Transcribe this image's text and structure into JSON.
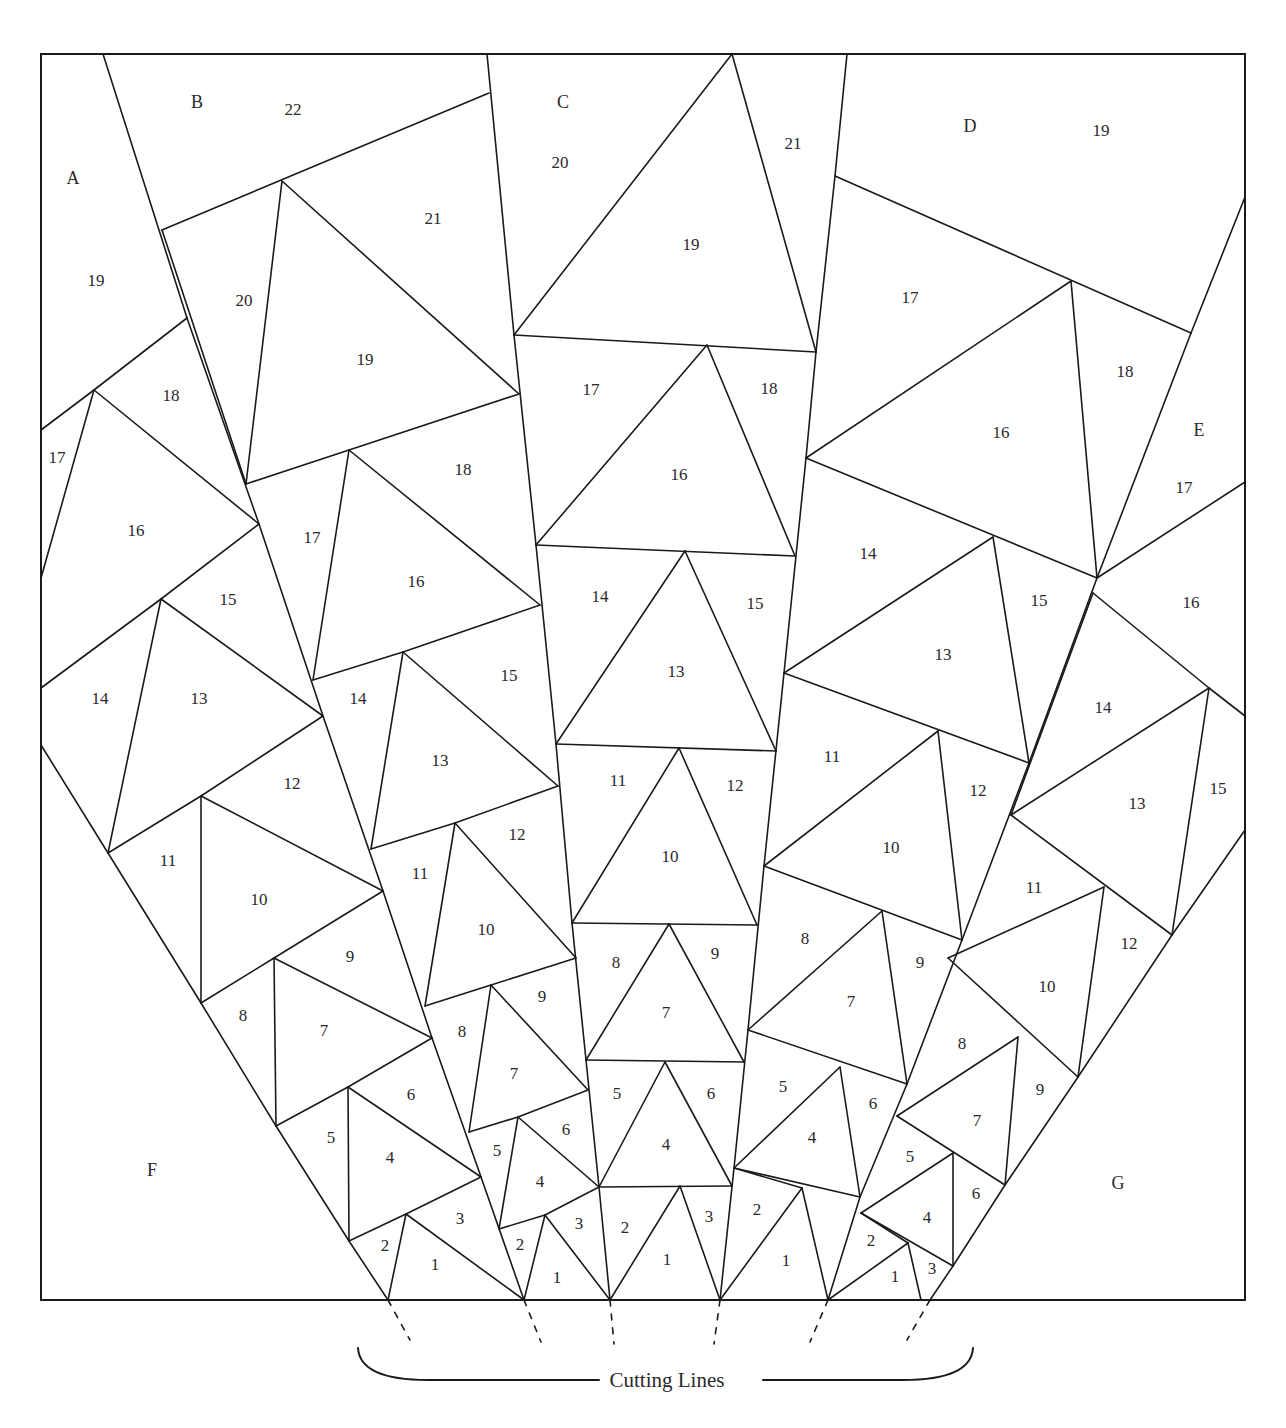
{
  "figure": {
    "type": "foundation paper-piecing quilt pattern",
    "border": {
      "x1": 41,
      "y1": 54,
      "x2": 1245,
      "y2": 1300
    },
    "stroke_color": "#1a1a1a",
    "background": "#ffffff"
  },
  "sections": [
    {
      "id": "A",
      "x": 73,
      "y": 178
    },
    {
      "id": "B",
      "x": 197,
      "y": 102
    },
    {
      "id": "C",
      "x": 563,
      "y": 102
    },
    {
      "id": "D",
      "x": 970,
      "y": 126
    },
    {
      "id": "E",
      "x": 1199,
      "y": 430
    },
    {
      "id": "F",
      "x": 152,
      "y": 1170
    },
    {
      "id": "G",
      "x": 1118,
      "y": 1183
    }
  ],
  "piece_labels": [
    {
      "section": "A",
      "n": "19",
      "x": 96,
      "y": 280
    },
    {
      "section": "A",
      "n": "18",
      "x": 171,
      "y": 395
    },
    {
      "section": "A",
      "n": "17",
      "x": 57,
      "y": 457
    },
    {
      "section": "A",
      "n": "16",
      "x": 136,
      "y": 530
    },
    {
      "section": "A",
      "n": "15",
      "x": 228,
      "y": 599
    },
    {
      "section": "A",
      "n": "14",
      "x": 100,
      "y": 698
    },
    {
      "section": "A",
      "n": "13",
      "x": 199,
      "y": 698
    },
    {
      "section": "A",
      "n": "12",
      "x": 292,
      "y": 783
    },
    {
      "section": "A",
      "n": "11",
      "x": 168,
      "y": 860
    },
    {
      "section": "A",
      "n": "10",
      "x": 259,
      "y": 899
    },
    {
      "section": "A",
      "n": "9",
      "x": 350,
      "y": 956
    },
    {
      "section": "A",
      "n": "8",
      "x": 243,
      "y": 1015
    },
    {
      "section": "A",
      "n": "7",
      "x": 324,
      "y": 1030
    },
    {
      "section": "A",
      "n": "6",
      "x": 411,
      "y": 1094
    },
    {
      "section": "A",
      "n": "5",
      "x": 331,
      "y": 1137
    },
    {
      "section": "A",
      "n": "4",
      "x": 390,
      "y": 1157
    },
    {
      "section": "A",
      "n": "3",
      "x": 460,
      "y": 1218
    },
    {
      "section": "A",
      "n": "2",
      "x": 385,
      "y": 1245
    },
    {
      "section": "A",
      "n": "1",
      "x": 435,
      "y": 1264
    },
    {
      "section": "B",
      "n": "22",
      "x": 293,
      "y": 109
    },
    {
      "section": "B",
      "n": "21",
      "x": 433,
      "y": 218
    },
    {
      "section": "B",
      "n": "20",
      "x": 244,
      "y": 300
    },
    {
      "section": "B",
      "n": "19",
      "x": 365,
      "y": 359
    },
    {
      "section": "B",
      "n": "18",
      "x": 463,
      "y": 469
    },
    {
      "section": "B",
      "n": "17",
      "x": 312,
      "y": 537
    },
    {
      "section": "B",
      "n": "16",
      "x": 416,
      "y": 581
    },
    {
      "section": "B",
      "n": "15",
      "x": 509,
      "y": 675
    },
    {
      "section": "B",
      "n": "14",
      "x": 358,
      "y": 698
    },
    {
      "section": "B",
      "n": "13",
      "x": 440,
      "y": 760
    },
    {
      "section": "B",
      "n": "12",
      "x": 517,
      "y": 834
    },
    {
      "section": "B",
      "n": "11",
      "x": 420,
      "y": 873
    },
    {
      "section": "B",
      "n": "10",
      "x": 486,
      "y": 929
    },
    {
      "section": "B",
      "n": "9",
      "x": 542,
      "y": 996
    },
    {
      "section": "B",
      "n": "8",
      "x": 462,
      "y": 1031
    },
    {
      "section": "B",
      "n": "7",
      "x": 514,
      "y": 1073
    },
    {
      "section": "B",
      "n": "6",
      "x": 566,
      "y": 1129
    },
    {
      "section": "B",
      "n": "5",
      "x": 497,
      "y": 1150
    },
    {
      "section": "B",
      "n": "4",
      "x": 540,
      "y": 1181
    },
    {
      "section": "B",
      "n": "3",
      "x": 579,
      "y": 1223
    },
    {
      "section": "B",
      "n": "2",
      "x": 520,
      "y": 1244
    },
    {
      "section": "B",
      "n": "1",
      "x": 557,
      "y": 1277
    },
    {
      "section": "C",
      "n": "20",
      "x": 560,
      "y": 162
    },
    {
      "section": "C",
      "n": "21",
      "x": 793,
      "y": 143
    },
    {
      "section": "C",
      "n": "19",
      "x": 691,
      "y": 244
    },
    {
      "section": "C",
      "n": "17",
      "x": 591,
      "y": 389
    },
    {
      "section": "C",
      "n": "18",
      "x": 769,
      "y": 388
    },
    {
      "section": "C",
      "n": "16",
      "x": 679,
      "y": 474
    },
    {
      "section": "C",
      "n": "14",
      "x": 600,
      "y": 596
    },
    {
      "section": "C",
      "n": "15",
      "x": 755,
      "y": 603
    },
    {
      "section": "C",
      "n": "13",
      "x": 676,
      "y": 671
    },
    {
      "section": "C",
      "n": "11",
      "x": 618,
      "y": 780
    },
    {
      "section": "C",
      "n": "12",
      "x": 735,
      "y": 785
    },
    {
      "section": "C",
      "n": "10",
      "x": 670,
      "y": 856
    },
    {
      "section": "C",
      "n": "8",
      "x": 616,
      "y": 962
    },
    {
      "section": "C",
      "n": "9",
      "x": 715,
      "y": 953
    },
    {
      "section": "C",
      "n": "7",
      "x": 666,
      "y": 1012
    },
    {
      "section": "C",
      "n": "5",
      "x": 617,
      "y": 1093
    },
    {
      "section": "C",
      "n": "6",
      "x": 711,
      "y": 1093
    },
    {
      "section": "C",
      "n": "4",
      "x": 666,
      "y": 1144
    },
    {
      "section": "C",
      "n": "2",
      "x": 625,
      "y": 1227
    },
    {
      "section": "C",
      "n": "3",
      "x": 709,
      "y": 1216
    },
    {
      "section": "C",
      "n": "1",
      "x": 667,
      "y": 1259
    },
    {
      "section": "D",
      "n": "19",
      "x": 1101,
      "y": 130
    },
    {
      "section": "D",
      "n": "17",
      "x": 910,
      "y": 297
    },
    {
      "section": "D",
      "n": "18",
      "x": 1125,
      "y": 371
    },
    {
      "section": "D",
      "n": "16",
      "x": 1001,
      "y": 432
    },
    {
      "section": "D",
      "n": "14",
      "x": 868,
      "y": 553
    },
    {
      "section": "D",
      "n": "15",
      "x": 1039,
      "y": 600
    },
    {
      "section": "D",
      "n": "13",
      "x": 943,
      "y": 654
    },
    {
      "section": "D",
      "n": "11",
      "x": 832,
      "y": 756
    },
    {
      "section": "D",
      "n": "12",
      "x": 978,
      "y": 790
    },
    {
      "section": "D",
      "n": "10",
      "x": 891,
      "y": 847
    },
    {
      "section": "D",
      "n": "8",
      "x": 805,
      "y": 938
    },
    {
      "section": "D",
      "n": "9",
      "x": 920,
      "y": 962
    },
    {
      "section": "D",
      "n": "7",
      "x": 851,
      "y": 1001
    },
    {
      "section": "D",
      "n": "5",
      "x": 783,
      "y": 1086
    },
    {
      "section": "D",
      "n": "6",
      "x": 873,
      "y": 1103
    },
    {
      "section": "D",
      "n": "4",
      "x": 812,
      "y": 1137
    },
    {
      "section": "D",
      "n": "2",
      "x": 757,
      "y": 1209
    },
    {
      "section": "D",
      "n": "1",
      "x": 786,
      "y": 1260
    },
    {
      "section": "E",
      "n": "17",
      "x": 1184,
      "y": 487
    },
    {
      "section": "E",
      "n": "16",
      "x": 1191,
      "y": 602
    },
    {
      "section": "E",
      "n": "14",
      "x": 1103,
      "y": 707
    },
    {
      "section": "E",
      "n": "15",
      "x": 1218,
      "y": 788
    },
    {
      "section": "E",
      "n": "13",
      "x": 1137,
      "y": 803
    },
    {
      "section": "E",
      "n": "11",
      "x": 1034,
      "y": 887
    },
    {
      "section": "E",
      "n": "12",
      "x": 1129,
      "y": 943
    },
    {
      "section": "E",
      "n": "10",
      "x": 1047,
      "y": 986
    },
    {
      "section": "E",
      "n": "8",
      "x": 962,
      "y": 1043
    },
    {
      "section": "E",
      "n": "9",
      "x": 1040,
      "y": 1089
    },
    {
      "section": "E",
      "n": "7",
      "x": 977,
      "y": 1120
    },
    {
      "section": "E",
      "n": "5",
      "x": 910,
      "y": 1156
    },
    {
      "section": "E",
      "n": "6",
      "x": 976,
      "y": 1193
    },
    {
      "section": "E",
      "n": "4",
      "x": 927,
      "y": 1217
    },
    {
      "section": "E",
      "n": "2",
      "x": 871,
      "y": 1240
    },
    {
      "section": "E",
      "n": "1",
      "x": 895,
      "y": 1276
    },
    {
      "section": "E",
      "n": "3",
      "x": 932,
      "y": 1268
    }
  ],
  "seams": [
    [
      103,
      54,
      187,
      318
    ],
    [
      187,
      318,
      259,
      524
    ],
    [
      259,
      524,
      323,
      716
    ],
    [
      323,
      716,
      383,
      891
    ],
    [
      383,
      891,
      432,
      1038
    ],
    [
      432,
      1038,
      481,
      1177
    ],
    [
      481,
      1177,
      524,
      1300
    ],
    [
      41,
      430,
      94,
      390
    ],
    [
      94,
      390,
      187,
      318
    ],
    [
      94,
      390,
      41,
      578
    ],
    [
      94,
      390,
      259,
      524
    ],
    [
      41,
      688,
      161,
      599
    ],
    [
      161,
      599,
      259,
      524
    ],
    [
      161,
      599,
      108,
      853
    ],
    [
      161,
      599,
      323,
      716
    ],
    [
      41,
      745,
      108,
      853
    ],
    [
      108,
      853,
      201,
      796
    ],
    [
      201,
      796,
      323,
      716
    ],
    [
      201,
      796,
      201,
      1003
    ],
    [
      201,
      796,
      383,
      891
    ],
    [
      108,
      853,
      201,
      1003
    ],
    [
      201,
      1003,
      274,
      958
    ],
    [
      274,
      958,
      383,
      891
    ],
    [
      274,
      958,
      276,
      1126
    ],
    [
      274,
      958,
      432,
      1038
    ],
    [
      201,
      1003,
      276,
      1126
    ],
    [
      276,
      1126,
      348,
      1087
    ],
    [
      348,
      1087,
      432,
      1038
    ],
    [
      348,
      1087,
      349,
      1241
    ],
    [
      348,
      1087,
      481,
      1177
    ],
    [
      276,
      1126,
      349,
      1241
    ],
    [
      349,
      1241,
      406,
      1214
    ],
    [
      406,
      1214,
      481,
      1177
    ],
    [
      406,
      1214,
      388,
      1300
    ],
    [
      406,
      1214,
      524,
      1300
    ],
    [
      349,
      1241,
      388,
      1300
    ],
    [
      162,
      230,
      489,
      93
    ],
    [
      282,
      181,
      246,
      484
    ],
    [
      282,
      181,
      519,
      394
    ],
    [
      162,
      230,
      246,
      484
    ],
    [
      246,
      484,
      349,
      450
    ],
    [
      349,
      450,
      519,
      394
    ],
    [
      349,
      450,
      313,
      680
    ],
    [
      349,
      450,
      540,
      605
    ],
    [
      313,
      680,
      403,
      652
    ],
    [
      403,
      652,
      540,
      605
    ],
    [
      403,
      652,
      371,
      849
    ],
    [
      403,
      652,
      558,
      786
    ],
    [
      371,
      849,
      455,
      823
    ],
    [
      455,
      823,
      558,
      786
    ],
    [
      455,
      823,
      425,
      1006
    ],
    [
      455,
      823,
      576,
      958
    ],
    [
      425,
      1006,
      491,
      985
    ],
    [
      491,
      985,
      576,
      958
    ],
    [
      491,
      985,
      469,
      1132
    ],
    [
      491,
      985,
      588,
      1090
    ],
    [
      469,
      1132,
      518,
      1117
    ],
    [
      518,
      1117,
      588,
      1090
    ],
    [
      518,
      1117,
      499,
      1229
    ],
    [
      518,
      1117,
      599,
      1187
    ],
    [
      499,
      1229,
      545,
      1215
    ],
    [
      545,
      1215,
      599,
      1187
    ],
    [
      545,
      1215,
      524,
      1300
    ],
    [
      545,
      1215,
      610,
      1300
    ],
    [
      487,
      54,
      514,
      335
    ],
    [
      514,
      335,
      536,
      545
    ],
    [
      536,
      545,
      556,
      744
    ],
    [
      556,
      744,
      572,
      923
    ],
    [
      572,
      923,
      586,
      1060
    ],
    [
      586,
      1060,
      599,
      1187
    ],
    [
      599,
      1187,
      610,
      1300
    ],
    [
      732,
      54,
      514,
      335
    ],
    [
      732,
      54,
      816,
      352
    ],
    [
      514,
      335,
      816,
      352
    ],
    [
      707,
      345,
      536,
      545
    ],
    [
      707,
      345,
      795,
      556
    ],
    [
      536,
      545,
      795,
      556
    ],
    [
      685,
      551,
      556,
      744
    ],
    [
      685,
      551,
      776,
      751
    ],
    [
      556,
      744,
      776,
      751
    ],
    [
      679,
      748,
      572,
      923
    ],
    [
      679,
      748,
      757,
      925
    ],
    [
      572,
      923,
      757,
      925
    ],
    [
      669,
      924,
      586,
      1060
    ],
    [
      669,
      924,
      744,
      1062
    ],
    [
      586,
      1060,
      744,
      1062
    ],
    [
      665,
      1062,
      599,
      1187
    ],
    [
      665,
      1062,
      732,
      1186
    ],
    [
      599,
      1187,
      732,
      1186
    ],
    [
      680,
      1186,
      610,
      1300
    ],
    [
      680,
      1186,
      720,
      1300
    ],
    [
      847,
      54,
      835,
      176
    ],
    [
      835,
      176,
      816,
      352
    ],
    [
      816,
      352,
      806,
      458
    ],
    [
      806,
      458,
      784,
      673
    ],
    [
      784,
      673,
      764,
      866
    ],
    [
      764,
      866,
      748,
      1030
    ],
    [
      748,
      1030,
      734,
      1168
    ],
    [
      734,
      1168,
      720,
      1300
    ],
    [
      835,
      176,
      1191,
      333
    ],
    [
      1191,
      333,
      1245,
      197
    ],
    [
      1071,
      281,
      806,
      458
    ],
    [
      1071,
      281,
      1097,
      578
    ],
    [
      806,
      458,
      1097,
      578
    ],
    [
      1191,
      333,
      1097,
      578
    ],
    [
      1097,
      578,
      1245,
      482
    ],
    [
      993,
      537,
      784,
      673
    ],
    [
      993,
      537,
      1029,
      763
    ],
    [
      784,
      673,
      1029,
      763
    ],
    [
      1097,
      578,
      1029,
      763
    ],
    [
      1093,
      593,
      1209,
      688
    ],
    [
      1209,
      688,
      1245,
      716
    ],
    [
      1093,
      593,
      1011,
      815
    ],
    [
      938,
      731,
      764,
      866
    ],
    [
      938,
      731,
      962,
      940
    ],
    [
      764,
      866,
      962,
      940
    ],
    [
      1029,
      763,
      962,
      940
    ],
    [
      1011,
      815,
      1209,
      688
    ],
    [
      1209,
      688,
      1172,
      935
    ],
    [
      1011,
      815,
      1172,
      935
    ],
    [
      1172,
      935,
      1245,
      830
    ],
    [
      882,
      911,
      748,
      1030
    ],
    [
      882,
      911,
      907,
      1084
    ],
    [
      748,
      1030,
      907,
      1084
    ],
    [
      962,
      940,
      907,
      1084
    ],
    [
      1104,
      887,
      1078,
      1077
    ],
    [
      948,
      958,
      1104,
      887
    ],
    [
      948,
      958,
      1078,
      1077
    ],
    [
      1078,
      1077,
      1172,
      935
    ],
    [
      840,
      1067,
      734,
      1168
    ],
    [
      840,
      1067,
      860,
      1197
    ],
    [
      734,
      1168,
      860,
      1197
    ],
    [
      907,
      1084,
      860,
      1197
    ],
    [
      1018,
      1037,
      1005,
      1185
    ],
    [
      897,
      1116,
      1018,
      1037
    ],
    [
      897,
      1116,
      1005,
      1185
    ],
    [
      1005,
      1185,
      1078,
      1077
    ],
    [
      802,
      1188,
      828,
      1300
    ],
    [
      734,
      1168,
      802,
      1188
    ],
    [
      802,
      1188,
      720,
      1300
    ],
    [
      860,
      1197,
      828,
      1300
    ],
    [
      953,
      1153,
      953,
      1266
    ],
    [
      861,
      1213,
      953,
      1153
    ],
    [
      861,
      1213,
      953,
      1266
    ],
    [
      953,
      1266,
      1005,
      1185
    ],
    [
      908,
      1243,
      828,
      1300
    ],
    [
      908,
      1243,
      921,
      1300
    ],
    [
      861,
      1213,
      908,
      1243
    ],
    [
      953,
      1266,
      930,
      1300
    ]
  ],
  "cutting_lines": {
    "label": "Cutting Lines",
    "dashes": [
      [
        388,
        1300,
        410,
        1340
      ],
      [
        524,
        1300,
        541,
        1342
      ],
      [
        610,
        1300,
        614,
        1344
      ],
      [
        720,
        1300,
        714,
        1344
      ],
      [
        828,
        1300,
        810,
        1342
      ],
      [
        930,
        1300,
        907,
        1340
      ]
    ],
    "brace": {
      "left_x": 358,
      "right_x": 973,
      "top_y": 1348,
      "bottom_y": 1380,
      "label_x": 667,
      "label_y": 1387
    }
  }
}
